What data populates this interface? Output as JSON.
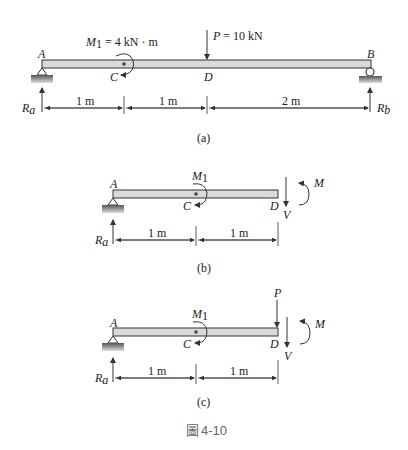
{
  "figure": {
    "caption": "4-10",
    "caption_prefix": "圖",
    "colors": {
      "beam_fill": "#d9d9d9",
      "beam_stroke": "#333333",
      "ground": "#777777",
      "text": "#222222",
      "caption": "#666666"
    }
  },
  "panel_a": {
    "label": "(a)",
    "points": {
      "A": "A",
      "B": "B",
      "C": "C",
      "D": "D"
    },
    "moment_label": "M",
    "moment_sub": "1",
    "moment_value": " = 4 kN · m",
    "load_label": "P",
    "load_value": " = 10 kN",
    "reactions": {
      "Ra": "R",
      "Ra_sub": "a",
      "Rb": "R",
      "Rb_sub": "b"
    },
    "dims": [
      "1 m",
      "1 m",
      "2 m"
    ]
  },
  "panel_b": {
    "label": "(b)",
    "points": {
      "A": "A",
      "C": "C",
      "D": "D"
    },
    "moment_label": "M",
    "moment_sub": "1",
    "internal_moment": "M",
    "shear": "V",
    "reactions": {
      "Ra": "R",
      "Ra_sub": "a"
    },
    "dims": [
      "1 m",
      "1 m"
    ]
  },
  "panel_c": {
    "label": "(c)",
    "points": {
      "A": "A",
      "C": "C",
      "D": "D"
    },
    "moment_label": "M",
    "moment_sub": "1",
    "load_label": "P",
    "internal_moment": "M",
    "shear": "V",
    "reactions": {
      "Ra": "R",
      "Ra_sub": "a"
    },
    "dims": [
      "1 m",
      "1 m"
    ]
  }
}
